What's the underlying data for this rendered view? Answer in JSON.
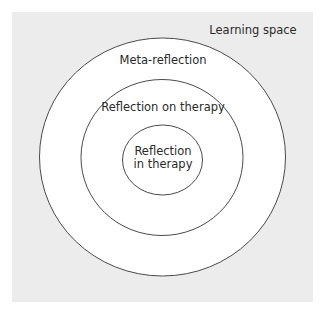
{
  "diagram": {
    "type": "concentric-circles",
    "background_color": "#ececec",
    "ring_fill": "#ffffff",
    "stroke_color": "#4a4a4a",
    "space_label": "Learning space",
    "rings": [
      {
        "level": "outer",
        "label": "Meta-reflection"
      },
      {
        "level": "middle",
        "label": "Reflection on therapy"
      },
      {
        "level": "inner",
        "label_line1": "Reflection",
        "label_line2": "in therapy"
      }
    ]
  }
}
